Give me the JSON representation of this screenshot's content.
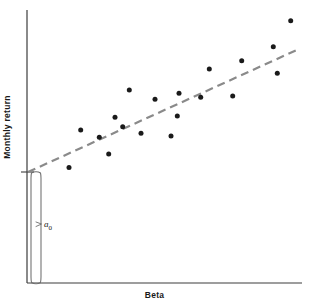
{
  "figure": {
    "width": 309,
    "height": 307,
    "background": "#ffffff",
    "axis_color": "#3c3c3c",
    "dot_color": "#1a1a1a",
    "trendline_color": "#8a8a8a",
    "bracket_color": "#6e6e6e"
  },
  "labels": {
    "y_axis": "Monthly return",
    "x_axis": "Beta",
    "intercept_symbol": "a",
    "intercept_subscript": "0"
  },
  "chart_data": {
    "type": "scatter",
    "title": "",
    "subtitle": "",
    "xlabel": "Beta",
    "ylabel": "Monthly return",
    "xlim": [
      0,
      1
    ],
    "ylim": [
      0,
      1
    ],
    "grid": false,
    "legend": "none",
    "axis_ticks": [],
    "annotations": [
      {
        "name": "intercept-bracket",
        "text": "a0",
        "description": "Vertical bracket from origin up to the y-intercept of the fitted line, labelled a sub 0",
        "x_px": 35,
        "y_top_px": 172,
        "y_bottom_px": 283
      },
      {
        "name": "y-intercept-tick",
        "description": "Short horizontal tick on the y-axis marking the regression line intercept",
        "x_px": 28,
        "y_px": 172
      }
    ],
    "series": [
      {
        "name": "Securities",
        "marker": "filled-circle",
        "marker_size_px": 5,
        "color": "#1a1a1a",
        "points_px": [
          {
            "x": 69.0,
            "y": 167.5
          },
          {
            "x": 80.7,
            "y": 130.0
          },
          {
            "x": 99.3,
            "y": 137.3
          },
          {
            "x": 108.7,
            "y": 154.0
          },
          {
            "x": 115.0,
            "y": 117.3
          },
          {
            "x": 122.7,
            "y": 126.7
          },
          {
            "x": 129.3,
            "y": 90.0
          },
          {
            "x": 141.0,
            "y": 133.3
          },
          {
            "x": 155.0,
            "y": 99.3
          },
          {
            "x": 171.0,
            "y": 136.0
          },
          {
            "x": 177.3,
            "y": 116.0
          },
          {
            "x": 179.0,
            "y": 93.3
          },
          {
            "x": 200.7,
            "y": 97.3
          },
          {
            "x": 209.3,
            "y": 69.0
          },
          {
            "x": 232.7,
            "y": 96.0
          },
          {
            "x": 241.7,
            "y": 60.7
          },
          {
            "x": 273.3,
            "y": 46.7
          },
          {
            "x": 277.3,
            "y": 73.3
          },
          {
            "x": 290.7,
            "y": 20.7
          }
        ]
      }
    ],
    "trendline": {
      "name": "Security market line (fitted)",
      "style": "dashed",
      "color": "#8a8a8a",
      "width_px": 2.2,
      "dash_px": [
        8,
        5
      ],
      "x1_px": 28,
      "y1_px": 172,
      "x2_px": 299,
      "y2_px": 49
    },
    "axes_px": {
      "y_axis": {
        "x": 27,
        "y_top": 10,
        "y_bottom": 283
      },
      "x_axis": {
        "y": 283,
        "x_left": 27,
        "x_right": 302
      }
    }
  }
}
